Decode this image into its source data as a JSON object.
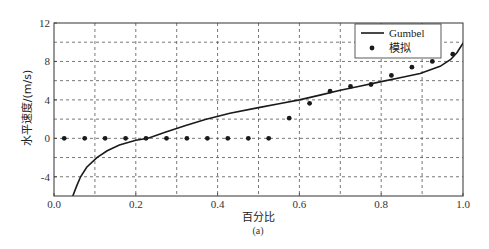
{
  "chart_data": {
    "type": "line",
    "title": "",
    "caption": "(a)",
    "xlabel": "百分比",
    "ylabel": "水平速度/(m/s)",
    "xlim": [
      0.0,
      1.0
    ],
    "ylim": [
      -6,
      12
    ],
    "xticks": [
      0.0,
      0.2,
      0.4,
      0.6,
      0.8,
      1.0
    ],
    "xtick_labels": [
      "0.0",
      "0.2",
      "0.4",
      "0.6",
      "0.8",
      "1.0"
    ],
    "yticks": [
      -4,
      0,
      4,
      8,
      12
    ],
    "ytick_labels": [
      "-4",
      "0",
      "4",
      "8",
      "12"
    ],
    "grid": true,
    "grid_x": [
      0.1,
      0.2,
      0.3,
      0.4,
      0.5,
      0.6,
      0.7,
      0.8,
      0.9
    ],
    "grid_y": [
      -4,
      -2,
      0,
      2,
      4,
      6,
      8,
      10
    ],
    "legend_position": "upper right",
    "series": [
      {
        "name": "Gumbel",
        "kind": "line",
        "color": "#1a1a1a",
        "x": [
          0.046,
          0.055,
          0.065,
          0.08,
          0.105,
          0.13,
          0.16,
          0.2,
          0.23,
          0.27,
          0.32,
          0.37,
          0.43,
          0.5,
          0.55,
          0.6,
          0.65,
          0.7,
          0.75,
          0.8,
          0.846,
          0.895,
          0.944,
          0.97,
          0.985,
          1.0
        ],
        "y": [
          -6.0,
          -5.0,
          -4.0,
          -3.0,
          -2.0,
          -1.3,
          -0.7,
          -0.2,
          0.0,
          0.6,
          1.3,
          1.95,
          2.6,
          3.2,
          3.6,
          4.0,
          4.5,
          5.0,
          5.45,
          5.9,
          6.3,
          6.75,
          7.5,
          8.2,
          8.9,
          9.9
        ]
      },
      {
        "name": "模拟",
        "kind": "scatter",
        "color": "#1a1a1a",
        "x": [
          0.025,
          0.075,
          0.125,
          0.175,
          0.225,
          0.275,
          0.325,
          0.375,
          0.425,
          0.475,
          0.525,
          0.575,
          0.625,
          0.675,
          0.725,
          0.775,
          0.825,
          0.875,
          0.925,
          0.975
        ],
        "y": [
          0,
          0,
          0,
          0,
          0,
          0,
          0,
          0,
          0,
          0,
          0,
          2.1,
          3.65,
          4.9,
          5.4,
          5.6,
          6.55,
          7.4,
          8.0,
          8.75
        ]
      }
    ]
  }
}
